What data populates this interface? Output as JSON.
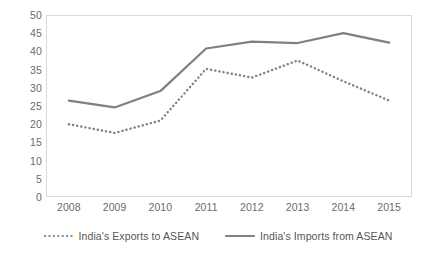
{
  "chart_data": {
    "type": "line",
    "title": "",
    "xlabel": "",
    "ylabel": "",
    "categories": [
      "2008",
      "2009",
      "2010",
      "2011",
      "2012",
      "2013",
      "2014",
      "2015"
    ],
    "x": [
      2008,
      2009,
      2010,
      2011,
      2012,
      2013,
      2014,
      2015
    ],
    "ylim": [
      0,
      50
    ],
    "yticks": [
      0,
      5,
      10,
      15,
      20,
      25,
      30,
      35,
      40,
      45,
      50
    ],
    "ytick_labels": [
      "0",
      "5",
      "10",
      "15",
      "20",
      "25",
      "30",
      "35",
      "40",
      "45",
      "50"
    ],
    "grid": false,
    "legend_position": "bottom",
    "series": [
      {
        "name": "India's Exports to ASEAN",
        "style": "dotted",
        "color": "#808080",
        "values": [
          20.0,
          17.6,
          21.0,
          35.2,
          32.8,
          37.5,
          31.8,
          26.5
        ]
      },
      {
        "name": "India's Imports from ASEAN",
        "style": "solid",
        "color": "#808080",
        "values": [
          26.5,
          24.6,
          29.1,
          40.8,
          42.7,
          42.3,
          45.0,
          42.4
        ]
      }
    ]
  },
  "legend": {
    "entries": [
      {
        "label": "India's Exports to ASEAN"
      },
      {
        "label": "India's Imports from ASEAN"
      }
    ]
  },
  "colors": {
    "line": "#808080",
    "axis_text": "#6b6b6b",
    "legend_text": "#565656",
    "plot_border": "#d9d9d9",
    "background": "#ffffff"
  }
}
